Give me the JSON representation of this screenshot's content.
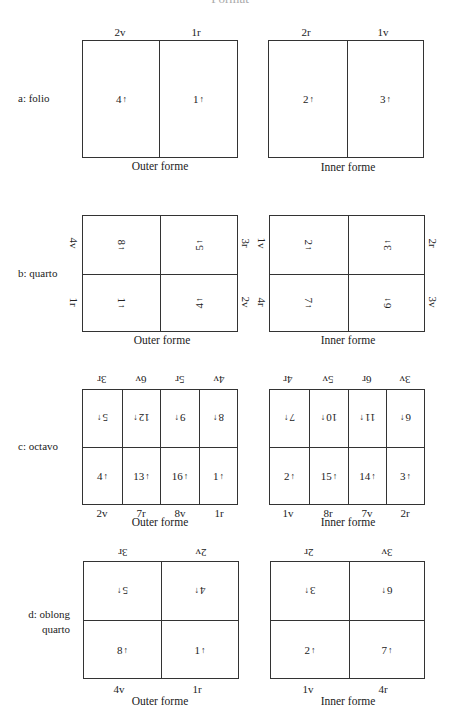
{
  "header": {
    "title": "Format"
  },
  "arrow_up": "↑",
  "arrow_down": "↓",
  "forme_labels": {
    "outer": "Outer forme",
    "inner": "Inner forme"
  },
  "formats": {
    "folio": {
      "label": "a: folio",
      "outer": {
        "top_labels": [
          "2v",
          "1r"
        ],
        "pages": [
          "4",
          "1"
        ]
      },
      "inner": {
        "top_labels": [
          "2r",
          "1v"
        ],
        "pages": [
          "2",
          "3"
        ]
      }
    },
    "quarto": {
      "label": "b: quarto",
      "outer": {
        "side_left": [
          "4v",
          "1r"
        ],
        "side_right": [
          "3r",
          "2v"
        ],
        "pages_top": [
          "8",
          "5"
        ],
        "pages_bottom": [
          "1",
          "4"
        ]
      },
      "inner": {
        "side_left": [
          "1v",
          "4r"
        ],
        "side_right": [
          "2r",
          "3v"
        ],
        "pages_top": [
          "2",
          "3"
        ],
        "pages_bottom": [
          "7",
          "6"
        ]
      }
    },
    "octavo": {
      "label": "c: octavo",
      "outer": {
        "top_labels": [
          "3r",
          "6v",
          "5r",
          "4v"
        ],
        "pages_top": [
          "5",
          "12",
          "9",
          "8"
        ],
        "pages_bottom": [
          "4",
          "13",
          "16",
          "1"
        ],
        "bottom_labels": [
          "2v",
          "7r",
          "8v",
          "1r"
        ]
      },
      "inner": {
        "top_labels": [
          "4r",
          "5v",
          "6r",
          "3v"
        ],
        "pages_top": [
          "7",
          "10",
          "11",
          "6"
        ],
        "pages_bottom": [
          "2",
          "15",
          "14",
          "3"
        ],
        "bottom_labels": [
          "1v",
          "8r",
          "7v",
          "2r"
        ]
      }
    },
    "oblong_quarto": {
      "label_line1": "d: oblong",
      "label_line2": "quarto",
      "outer": {
        "top_labels": [
          "3r",
          "2v"
        ],
        "pages_top": [
          "5",
          "4"
        ],
        "pages_bottom": [
          "8",
          "1"
        ],
        "bottom_labels": [
          "4v",
          "1r"
        ]
      },
      "inner": {
        "top_labels": [
          "2r",
          "3v"
        ],
        "pages_top": [
          "3",
          "6"
        ],
        "pages_bottom": [
          "2",
          "7"
        ],
        "bottom_labels": [
          "1v",
          "4r"
        ]
      }
    }
  }
}
